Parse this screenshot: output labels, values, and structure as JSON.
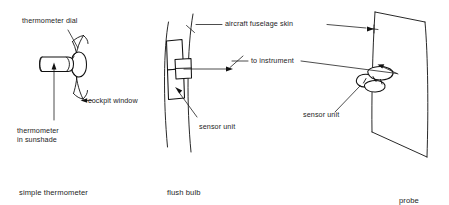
{
  "figure": {
    "title_visible": false,
    "panels": [
      {
        "id": "simple-thermometer",
        "caption": "simple thermometer",
        "labels": [
          {
            "key": "dial",
            "text": "thermometer dial"
          },
          {
            "key": "window",
            "text": "cockpit window"
          },
          {
            "key": "sunshade_line1",
            "text": "thermometer"
          },
          {
            "key": "sunshade_line2",
            "text": "in sunshade"
          }
        ]
      },
      {
        "id": "flush-bulb",
        "caption": "flush bulb",
        "labels": [
          {
            "key": "skin",
            "text": "aircraft fuselage skin"
          },
          {
            "key": "instrument",
            "text": "to instrument"
          },
          {
            "key": "sensor",
            "text": "sensor unit"
          }
        ]
      },
      {
        "id": "probe",
        "caption": "probe",
        "labels": [
          {
            "key": "sensor",
            "text": "sensor unit"
          }
        ]
      }
    ]
  },
  "labels": {
    "thermometer_dial": "thermometer dial",
    "cockpit_window": "cockpit window",
    "thermometer_in_sunshade_l1": "thermometer",
    "thermometer_in_sunshade_l2": "in sunshade",
    "aircraft_fuselage_skin": "aircraft fuselage skin",
    "to_instrument": "to instrument",
    "sensor_unit_middle": "sensor unit",
    "sensor_unit_right": "sensor unit"
  },
  "captions": {
    "left": "simple thermometer",
    "middle": "flush bulb",
    "right": "probe"
  },
  "colors": {
    "ink": "#111111",
    "text": "#1d1d1d",
    "background": "#ffffff"
  }
}
